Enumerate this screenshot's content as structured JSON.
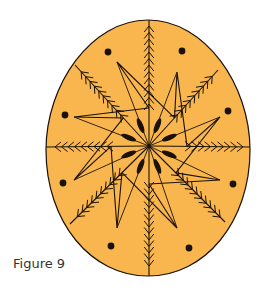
{
  "figure": {
    "caption": "Figure 9",
    "colors": {
      "fill": "#F9B64E",
      "stroke": "#1a1208",
      "background": "#ffffff"
    },
    "egg": {
      "cx": 148,
      "cy": 147,
      "rx": 102,
      "ry_top": 127,
      "ry_bottom": 129
    },
    "center": {
      "x": 149,
      "y": 146
    },
    "dots": [
      {
        "x": 108,
        "y": 52
      },
      {
        "x": 182,
        "y": 51
      },
      {
        "x": 65,
        "y": 115
      },
      {
        "x": 228,
        "y": 111
      },
      {
        "x": 63,
        "y": 183
      },
      {
        "x": 233,
        "y": 184
      },
      {
        "x": 111,
        "y": 246
      },
      {
        "x": 189,
        "y": 248
      }
    ],
    "star_points": [
      {
        "x": 117,
        "y": 62
      },
      {
        "x": 177,
        "y": 72
      },
      {
        "x": 220,
        "y": 117
      },
      {
        "x": 220,
        "y": 180
      },
      {
        "x": 177,
        "y": 228
      },
      {
        "x": 117,
        "y": 228
      },
      {
        "x": 74,
        "y": 180
      },
      {
        "x": 74,
        "y": 117
      }
    ],
    "branches": [
      {
        "x": 149,
        "y": 20
      },
      {
        "x": 218,
        "y": 70
      },
      {
        "x": 250,
        "y": 147
      },
      {
        "x": 225,
        "y": 222
      },
      {
        "x": 149,
        "y": 276
      },
      {
        "x": 70,
        "y": 224
      },
      {
        "x": 46,
        "y": 147
      },
      {
        "x": 75,
        "y": 65
      }
    ]
  }
}
